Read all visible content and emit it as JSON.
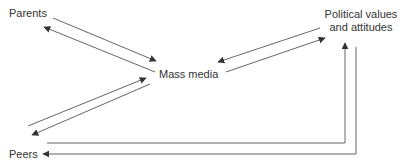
{
  "diagram": {
    "nodes": {
      "parents": {
        "label": "Parents"
      },
      "mass_media": {
        "label": "Mass media"
      },
      "political": {
        "line1": "Political values",
        "line2": "and attitudes"
      },
      "peers": {
        "label": "Peers"
      }
    },
    "edges": [
      {
        "from": "Parents",
        "to": "Mass media",
        "bidirectional": true
      },
      {
        "from": "Mass media",
        "to": "Political values and attitudes",
        "bidirectional": true
      },
      {
        "from": "Peers",
        "to": "Mass media",
        "bidirectional": true
      },
      {
        "from": "Peers",
        "to": "Political values and attitudes",
        "bidirectional": true
      }
    ],
    "colors": {
      "line": "#555555",
      "text": "#333333",
      "background": "#ffffff"
    }
  }
}
